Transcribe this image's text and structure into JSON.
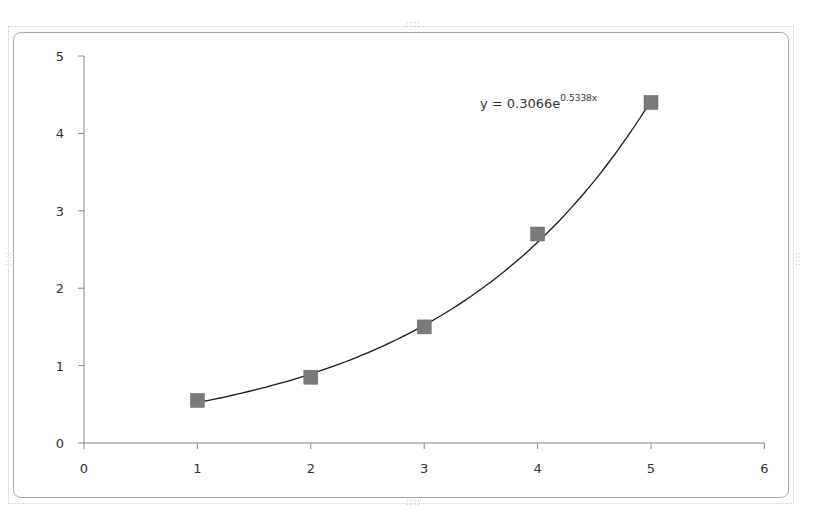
{
  "chart_data": {
    "type": "scatter",
    "title": "",
    "xlabel": "",
    "ylabel": "",
    "xlim": [
      0,
      6
    ],
    "ylim": [
      0,
      5
    ],
    "x_ticks": [
      "0",
      "1",
      "2",
      "3",
      "4",
      "5",
      "6"
    ],
    "y_ticks": [
      "0",
      "1",
      "2",
      "3",
      "4",
      "5"
    ],
    "grid": false,
    "legend": "none",
    "series": [
      {
        "name": "data",
        "marker": "square",
        "color": "#7a7a7a",
        "x": [
          1,
          2,
          3,
          4,
          5
        ],
        "y": [
          0.55,
          0.85,
          1.5,
          2.7,
          4.4
        ]
      }
    ],
    "trendline": {
      "type": "exponential",
      "a": 0.3066,
      "b": 0.5338,
      "color": "#1a1a1a",
      "x_range": [
        1,
        5
      ]
    },
    "annotations": [
      {
        "text_base": "y = 0.3066e",
        "text_exponent": "0.5338x"
      }
    ]
  },
  "frame": {
    "grip_glyph": "::::"
  }
}
